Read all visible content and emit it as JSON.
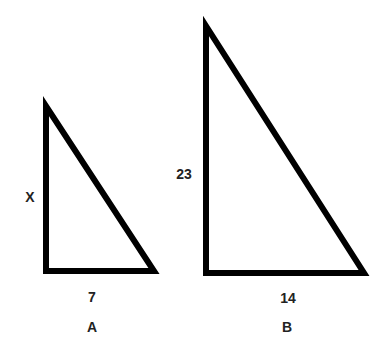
{
  "diagram": {
    "triangles": [
      {
        "name": "A",
        "vertices": [
          [
            46,
            106
          ],
          [
            46,
            271
          ],
          [
            154,
            271
          ]
        ],
        "labels": {
          "vertical_side": "X",
          "horizontal_side": "7",
          "name": "A"
        }
      },
      {
        "name": "B",
        "vertices": [
          [
            206,
            26
          ],
          [
            206,
            273
          ],
          [
            364,
            273
          ]
        ],
        "labels": {
          "vertical_side": "23",
          "horizontal_side": "14",
          "name": "B"
        }
      }
    ],
    "stroke_color": "#000000"
  }
}
